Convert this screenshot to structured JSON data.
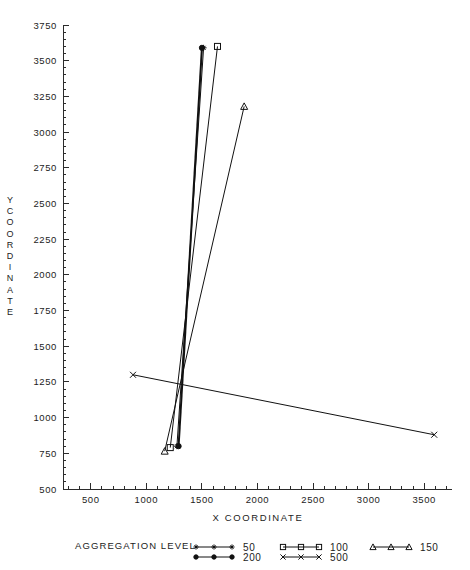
{
  "chart_data": {
    "type": "line",
    "title": "",
    "xlabel": "X COORDINATE",
    "ylabel": "Y COORDINATE",
    "xlim": [
      250,
      3750
    ],
    "ylim": [
      500,
      3750
    ],
    "xticks": [
      500,
      1000,
      1500,
      2000,
      2500,
      3000,
      3500
    ],
    "yticks": [
      500,
      750,
      1000,
      1250,
      1500,
      1750,
      2000,
      2250,
      2500,
      2750,
      3000,
      3250,
      3500,
      3750
    ],
    "xtick_labels": [
      "500",
      "1000",
      "1500",
      "2000",
      "2500",
      "3000",
      "3500"
    ],
    "ytick_labels": [
      "500",
      "750",
      "1000",
      "1250",
      "1500",
      "1750",
      "2000",
      "2250",
      "2500",
      "2750",
      "3000",
      "3250",
      "3500",
      "3750"
    ],
    "grid": false,
    "minor_ticks": true,
    "legend_position": "below-axes",
    "legend_title": "AGGREGATION LEVEL",
    "series": [
      {
        "name": "50",
        "marker": "plus",
        "line_width": 1,
        "x": [
          1275,
          1515
        ],
        "y": [
          800,
          3590
        ]
      },
      {
        "name": "100",
        "marker": "open-square",
        "line_width": 1,
        "x": [
          1215,
          1640
        ],
        "y": [
          790,
          3600
        ]
      },
      {
        "name": "150",
        "marker": "triangle",
        "line_width": 1,
        "x": [
          1165,
          1880
        ],
        "y": [
          765,
          3180
        ]
      },
      {
        "name": "200",
        "marker": "filled-circle",
        "line_width": 2,
        "x": [
          1290,
          1500
        ],
        "y": [
          800,
          3590
        ]
      },
      {
        "name": "500",
        "marker": "cross",
        "line_width": 1,
        "x": [
          880,
          3590
        ],
        "y": [
          1300,
          880
        ]
      }
    ]
  },
  "legend": {
    "title": "AGGREGATION LEVEL",
    "entries": [
      {
        "label": "50",
        "marker": "plus"
      },
      {
        "label": "100",
        "marker": "open-square"
      },
      {
        "label": "150",
        "marker": "triangle"
      },
      {
        "label": "200",
        "marker": "filled-circle"
      },
      {
        "label": "500",
        "marker": "cross"
      }
    ]
  },
  "axes": {
    "x_title": "X COORDINATE",
    "y_title_chars": [
      "Y",
      "C",
      "O",
      "O",
      "R",
      "D",
      "I",
      "N",
      "A",
      "T",
      "E"
    ]
  },
  "colors": {
    "ink": "#111111",
    "axis": "#2b2b2b",
    "background": "#ffffff"
  }
}
